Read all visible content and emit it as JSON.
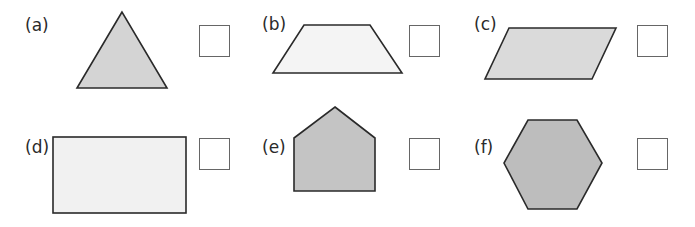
{
  "items": [
    {
      "label": "(a)",
      "shape": "triangle",
      "fill": "#d4d4d4"
    },
    {
      "label": "(b)",
      "shape": "trapezium",
      "fill": "#f4f4f4"
    },
    {
      "label": "(c)",
      "shape": "parallelogram",
      "fill": "#dadada"
    },
    {
      "label": "(d)",
      "shape": "rectangle",
      "fill": "#f1f1f1"
    },
    {
      "label": "(e)",
      "shape": "pentagon",
      "fill": "#c4c4c4"
    },
    {
      "label": "(f)",
      "shape": "hexagon",
      "fill": "#bdbdbd"
    }
  ],
  "colors": {
    "stroke": "#2a2a2a",
    "box_border": "#666666"
  }
}
